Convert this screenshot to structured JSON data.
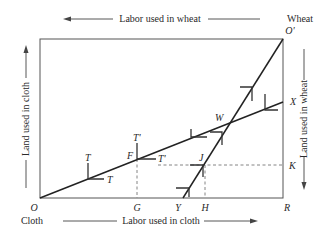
{
  "diagram": {
    "type": "edgeworth-box",
    "top_axis_label": "Labor used in wheat",
    "bottom_axis_label": "Labor used in cloth",
    "left_axis_label": "Land used in cloth",
    "right_axis_label": "Land used in wheat",
    "corner_top_right_good": "Wheat",
    "corner_top_right_origin": "O'",
    "corner_bottom_left_origin": "O",
    "corner_bottom_left_good": "Cloth",
    "corner_bottom_right": "R",
    "points": {
      "X": "X",
      "K": "K",
      "W": "W",
      "F": "F",
      "J": "J",
      "G": "G",
      "Y": "Y",
      "H": "H",
      "T1": "T",
      "T2": "T",
      "Tp1": "T'",
      "Tp2": "T'"
    },
    "lines": [
      {
        "name": "cloth-expansion-path",
        "from": "O",
        "to": "X"
      },
      {
        "name": "wheat-expansion-path",
        "from": "Y",
        "to": "O'"
      }
    ],
    "dashed_guides": [
      "F-G",
      "J-H",
      "T'-K"
    ]
  }
}
